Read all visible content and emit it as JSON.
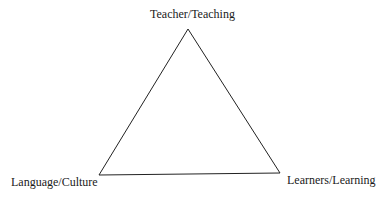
{
  "diagram": {
    "type": "triangle",
    "vertices": {
      "top": {
        "label": "Teacher/Teaching",
        "x": 188,
        "y": 29
      },
      "bottom_left": {
        "label": "Language/Culture",
        "x": 99,
        "y": 175
      },
      "bottom_right": {
        "label": "Learners/Learning",
        "x": 280,
        "y": 173
      }
    },
    "stroke_color": "#222222",
    "background_color": "#ffffff"
  }
}
